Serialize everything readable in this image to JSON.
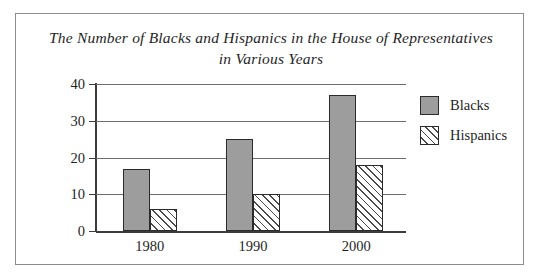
{
  "chart_data": {
    "type": "bar",
    "title": "The Number of Blacks and Hispanics in the House of Representatives in Various Years",
    "xlabel": "",
    "ylabel": "",
    "categories": [
      "1980",
      "1990",
      "2000"
    ],
    "series": [
      {
        "name": "Blacks",
        "values": [
          17,
          25,
          37
        ],
        "color": "#9d9d9d",
        "fill": "solid-gray"
      },
      {
        "name": "Hispanics",
        "values": [
          6,
          10,
          18
        ],
        "color": "#ffffff",
        "fill": "diagonal-hatch"
      }
    ],
    "ylim": [
      0,
      40
    ],
    "yticks": [
      "0",
      "10",
      "20",
      "30",
      "40"
    ],
    "ytick_values": [
      0,
      10,
      20,
      30,
      40
    ],
    "grid": true,
    "legend_position": "right"
  },
  "legend": {
    "entries": [
      {
        "label": "Blacks"
      },
      {
        "label": "Hispanics"
      }
    ]
  }
}
